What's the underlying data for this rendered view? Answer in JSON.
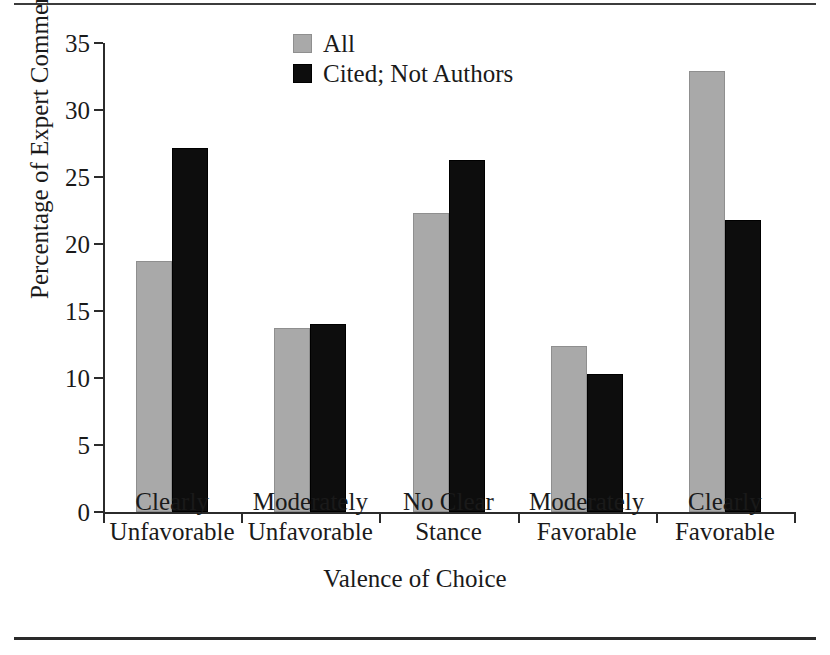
{
  "chart_data": {
    "type": "bar",
    "title": "",
    "xlabel": "Valence of Choice",
    "ylabel": "Percentage of Expert Comments",
    "categories": [
      "Clearly Unfavorable",
      "Moderately Unfavorable",
      "No Clear Stance",
      "Moderately Favorable",
      "Clearly Favorable"
    ],
    "category_lines": [
      [
        "Clearly",
        "Unfavorable"
      ],
      [
        "Moderately",
        "Unfavorable"
      ],
      [
        "No Clear",
        "Stance"
      ],
      [
        "Moderately",
        "Favorable"
      ],
      [
        "Clearly",
        "Favorable"
      ]
    ],
    "series": [
      {
        "name": "All",
        "color": "#a9a9a9",
        "values": [
          18.7,
          13.7,
          22.3,
          12.4,
          32.9
        ]
      },
      {
        "name": "Cited; Not Authors",
        "color": "#0d0d0d",
        "values": [
          27.2,
          14.0,
          26.3,
          10.3,
          21.8
        ]
      }
    ],
    "ylim": [
      0,
      35
    ],
    "yticks": [
      0,
      5,
      10,
      15,
      20,
      25,
      30,
      35
    ],
    "ytick_labels": [
      "0",
      "5",
      "10",
      "15",
      "20",
      "25",
      "30",
      "35"
    ],
    "grid": false,
    "legend_position": "top-center"
  },
  "legend": {
    "entries": [
      {
        "label": "All",
        "swatch": "gray-swatch"
      },
      {
        "label": "Cited; Not Authors",
        "swatch": "black-swatch"
      }
    ]
  },
  "axes": {
    "y_title": "Percentage of Expert Comments",
    "x_title": "Valence of Choice"
  }
}
